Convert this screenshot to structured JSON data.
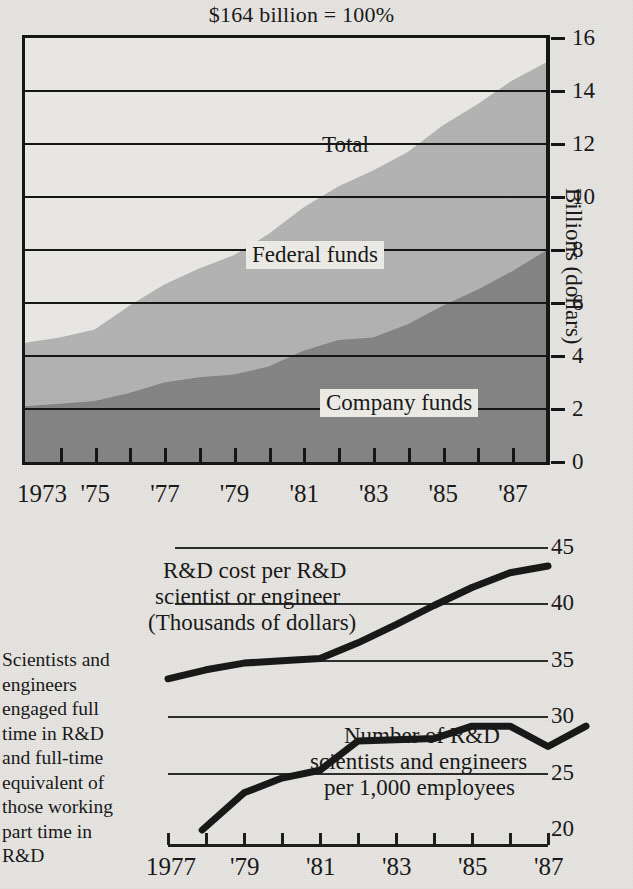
{
  "chart_data": [
    {
      "type": "area",
      "title": "$164 billion = 100%",
      "xlabel": "",
      "ylabel": "Billions (dollars)",
      "ylim": [
        0,
        16
      ],
      "ytick_labels": [
        "16",
        "14",
        "12",
        "10",
        "8",
        "6",
        "4",
        "2",
        "0"
      ],
      "yticks": [
        16,
        14,
        12,
        10,
        8,
        6,
        4,
        2,
        0
      ],
      "grid": true,
      "legend_position": "inline",
      "x": [
        1973,
        1974,
        1975,
        1976,
        1977,
        1978,
        1979,
        1980,
        1981,
        1982,
        1983,
        1984,
        1985,
        1986,
        1987
      ],
      "xtick_labels": [
        "1973",
        "'75",
        "'77",
        "'79",
        "'81",
        "'83",
        "'85",
        "'87"
      ],
      "xtick_values": [
        1973,
        1975,
        1977,
        1979,
        1981,
        1983,
        1985,
        1987
      ],
      "series": [
        {
          "name": "Company funds",
          "values": [
            2.1,
            2.2,
            2.3,
            2.6,
            3.0,
            3.2,
            3.3,
            3.6,
            4.2,
            4.6,
            4.7,
            5.2,
            5.9,
            6.5,
            7.2,
            8.0
          ]
        },
        {
          "name": "Federal funds",
          "values": [
            2.4,
            2.5,
            2.7,
            3.3,
            3.7,
            4.1,
            4.5,
            5.0,
            5.4,
            5.8,
            6.3,
            6.5,
            6.8,
            7.0,
            7.2,
            7.1
          ]
        },
        {
          "name": "Total",
          "values": [
            4.5,
            4.7,
            5.0,
            5.9,
            6.7,
            7.3,
            7.8,
            8.6,
            9.6,
            10.4,
            11.0,
            11.7,
            12.7,
            13.5,
            14.4,
            15.1
          ]
        }
      ],
      "labels": {
        "total": "Total",
        "federal": "Federal funds",
        "company": "Company funds"
      },
      "colors": {
        "company_funds": "#848484",
        "federal_funds": "#b4b4b4",
        "background": "#edebe7",
        "axis": "#111111"
      }
    },
    {
      "type": "line",
      "title": "",
      "ylim": [
        20,
        45
      ],
      "ytick_labels": [
        "45",
        "40",
        "35",
        "30",
        "25",
        "20"
      ],
      "yticks": [
        45,
        40,
        35,
        30,
        25,
        20
      ],
      "grid": true,
      "xtick_labels": [
        "1977",
        "'79",
        "'81",
        "'83",
        "'85",
        "'87"
      ],
      "xtick_values": [
        1977,
        1979,
        1981,
        1983,
        1985,
        1987
      ],
      "x": [
        1977,
        1978,
        1979,
        1980,
        1981,
        1982,
        1983,
        1984,
        1985,
        1986,
        1987
      ],
      "series": [
        {
          "name": "R&D cost per R&D scientist or engineer (Thousands of dollars)",
          "values": [
            33.4,
            34.2,
            34.8,
            35.0,
            35.2,
            36.6,
            38.2,
            39.9,
            41.5,
            42.8,
            43.4
          ]
        },
        {
          "name": "Number of R&D scientists and engineers per 1,000 employees",
          "values": [
            null,
            20.0,
            23.3,
            24.6,
            25.3,
            27.9,
            28.0,
            28.1,
            29.2,
            29.2,
            27.4,
            29.2
          ]
        }
      ],
      "annotations": {
        "cost_line_1": "R&D cost per R&D",
        "cost_line_2": "scientist or engineer",
        "cost_line_3": "(Thousands of  dollars)",
        "count_line_1": "Number of  R&D",
        "count_line_2": "scientists and engineers",
        "count_line_3": "per 1,000 employees",
        "side_note": "Scientists and engineers engaged full time in R&D and full-time equivalent of those working part time in R&D"
      },
      "colors": {
        "line": "#141414",
        "grid": "#2a2a2a"
      }
    }
  ],
  "top": {
    "title": "$164 billion = 100%",
    "y_axis_title": "Billions (dollars)",
    "y_labels": [
      "16",
      "14",
      "12",
      "10",
      "8",
      "6",
      "4",
      "2",
      "0"
    ],
    "x_labels": [
      "1973",
      "'75",
      "'77",
      "'79",
      "'81",
      "'83",
      "'85",
      "'87"
    ],
    "label_total": "Total",
    "label_federal": "Federal funds",
    "label_company": "Company funds"
  },
  "bottom": {
    "y_labels": [
      "45",
      "40",
      "35",
      "30",
      "25",
      "20"
    ],
    "x_labels": [
      "1977",
      "'79",
      "'81",
      "'83",
      "'85",
      "'87"
    ],
    "cost_l1": "R&D cost per R&D",
    "cost_l2": "scientist or engineer",
    "cost_l3": "(Thousands of  dollars)",
    "count_l1": "Number of  R&D",
    "count_l2": "scientists and engineers",
    "count_l3": "per 1,000 employees",
    "side_note": "Scientists and engineers engaged full time in R&D and full-time equivalent of those working part time in R&D"
  }
}
